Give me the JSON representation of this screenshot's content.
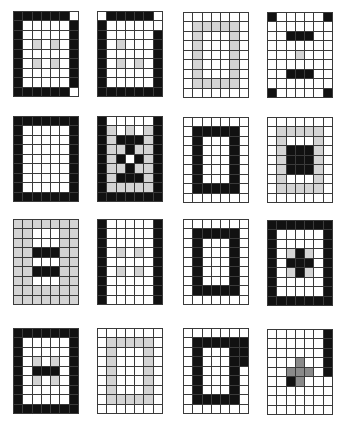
{
  "figure": {
    "rows": 4,
    "cols": 4,
    "cell_legend": {
      "W": "white",
      "B": "black",
      "G": "light-gray",
      "D": "dark-gray"
    },
    "colors": {
      "W": "#ffffff",
      "B": "#111111",
      "G": "#d4d4d4",
      "D": "#8a8a8a",
      "grid_line": "#3a3a3a"
    },
    "grid_size": {
      "columns": 7,
      "rows": 9
    },
    "patterns": [
      {
        "id": 1,
        "x": 13,
        "y": 11,
        "rows": [
          "BBBBBBW",
          "BWWWWWB",
          "BWWWWWB",
          "BWGWGWB",
          "BWWWWWB",
          "BWGWGWB",
          "BWWWWWB",
          "BWWWWWB",
          "BBBBBBW"
        ]
      },
      {
        "id": 2,
        "x": 97,
        "y": 11,
        "rows": [
          "WBBBBBW",
          "BWWWWWW",
          "BWWWWWB",
          "BWGWWWB",
          "BWWWWWB",
          "BWGWGWB",
          "BWWWWWB",
          "BWWWWWB",
          "BBBBBBB"
        ]
      },
      {
        "id": 3,
        "x": 183,
        "y": 12,
        "rows": [
          "WWWWWWW",
          "WGGGGGW",
          "WGWWWGW",
          "WGWWWGW",
          "WGWWWGW",
          "WGWWWGW",
          "WGWWWGW",
          "WGGGGGW",
          "WWWWWWW"
        ]
      },
      {
        "id": 4,
        "x": 267,
        "y": 12,
        "rows": [
          "BWWWWWB",
          "WWWWWWW",
          "WWBBBWW",
          "WWWWWWW",
          "WWWGWWW",
          "WWWWWWW",
          "WWBBBWW",
          "WWWWWWW",
          "BWWWWWB"
        ]
      },
      {
        "id": 5,
        "x": 13,
        "y": 116,
        "rows": [
          "BBBBBBB",
          "BWWWWWB",
          "BWWWWWB",
          "BWWWWWB",
          "BWWWWWB",
          "BWWWWWB",
          "BWWWWWB",
          "BWWWWWB",
          "BBBBBBB"
        ]
      },
      {
        "id": 6,
        "x": 97,
        "y": 116,
        "rows": [
          "BWWWWWB",
          "BGWGWGB",
          "BGBBBGB",
          "BGGBGGB",
          "BGBWBGB",
          "BGGBGGB",
          "BGBBBGB",
          "BGGGGGB",
          "BBBBBBB"
        ]
      },
      {
        "id": 7,
        "x": 183,
        "y": 117,
        "rows": [
          "WWWWWWW",
          "WBBBBBW",
          "WBWWWBW",
          "WBWWWBW",
          "WBWWWBW",
          "WBWWWBW",
          "WBWWWBW",
          "WBBBBBW",
          "WWWWWWW"
        ]
      },
      {
        "id": 8,
        "x": 267,
        "y": 117,
        "rows": [
          "WWWWWWW",
          "WGGGGGW",
          "WGWWWGW",
          "WGBBBGW",
          "WGBBBGW",
          "WGBBBGW",
          "WGWWWGW",
          "WGGGGGW",
          "WWWWWWW"
        ]
      },
      {
        "id": 9,
        "x": 13,
        "y": 219,
        "rows": [
          "GGGGGGG",
          "GGWWWGG",
          "GGWWWGG",
          "GGBBBGG",
          "GGWWWGG",
          "GGBBBGG",
          "GGWWWGG",
          "GGGGGGG",
          "GGGGGGG"
        ]
      },
      {
        "id": 10,
        "x": 97,
        "y": 219,
        "rows": [
          "BWWWWWB",
          "BWWWWWB",
          "BWWWWWB",
          "BWGWGWB",
          "BWWWWWB",
          "BWGWGWB",
          "BWWWWWB",
          "BWWWWWB",
          "BWWWWWB"
        ]
      },
      {
        "id": 11,
        "x": 183,
        "y": 219,
        "rows": [
          "WWWWWWW",
          "WBBBBBW",
          "WBWWWBW",
          "WBWWWBW",
          "WBWWWBW",
          "WBWWWBW",
          "WBWWWBW",
          "WBBBBBW",
          "WWWWWWW"
        ]
      },
      {
        "id": 12,
        "x": 267,
        "y": 220,
        "rows": [
          "BBBBBBB",
          "BWWWWWB",
          "BWWWWWB",
          "BWGBGWB",
          "BWBBBWB",
          "BWGBGWB",
          "BWWWWWB",
          "BWWWWWB",
          "BBBBBBB"
        ]
      },
      {
        "id": 13,
        "x": 13,
        "y": 328,
        "rows": [
          "BBBBBBB",
          "BWWWWWB",
          "BWWWWWB",
          "BWGWGWB",
          "BWBBBWB",
          "BWGWGWB",
          "BWWWWWB",
          "BWWWWWB",
          "BBBBBBB"
        ]
      },
      {
        "id": 14,
        "x": 97,
        "y": 328,
        "rows": [
          "WWWWWWW",
          "WGGGGGW",
          "WGWWWGW",
          "WGWWWGW",
          "WGWWWGW",
          "WGWWWGW",
          "WGWWWGW",
          "WGGGGGW",
          "WWWWWWW"
        ]
      },
      {
        "id": 15,
        "x": 183,
        "y": 328,
        "rows": [
          "WWWWWWW",
          "WBBBBBB",
          "WBWWWBB",
          "WBWWWBB",
          "WBWWWBW",
          "WBWWWBW",
          "WBWWWBW",
          "WBBBBBW",
          "WWWWWWW"
        ]
      },
      {
        "id": 16,
        "x": 267,
        "y": 329,
        "rows": [
          "WWWWWWB",
          "WWWWWWB",
          "WWWWWWB",
          "WWWDWWB",
          "WWDDDWB",
          "WWBDWWW",
          "WWWWWWW",
          "WWWWWWW",
          "WWWWWWW"
        ]
      }
    ]
  }
}
